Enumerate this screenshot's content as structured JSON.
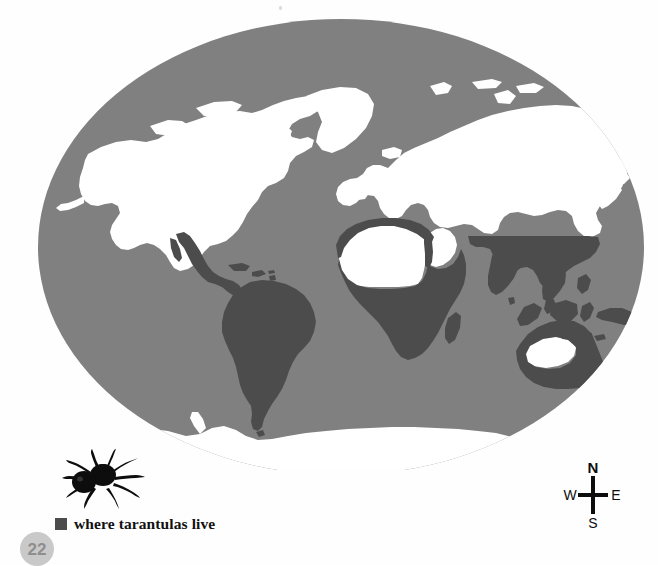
{
  "page": {
    "number": "22",
    "background_color": "#ffffff"
  },
  "map": {
    "title": "where tarantulas live",
    "projection": "elliptical world map",
    "colors": {
      "ocean": "#808080",
      "land_no_habitat": "#ffffff",
      "land_habitat": "#4c4c4c",
      "background": "#ffffff"
    },
    "regions_with_habitat": [
      "Mexico and Central America",
      "Caribbean",
      "South America",
      "Sub-Saharan Africa",
      "North-west Africa (Atlas / coastal Maghreb)",
      "Madagascar",
      "Southern Asia (India and Indochina)",
      "South-east Asia and Indonesia",
      "New Guinea",
      "Australia (coastal)"
    ],
    "regions_without_habitat": [
      "North America",
      "Greenland",
      "Europe",
      "Northern Asia",
      "Sahara interior",
      "Arabian Peninsula",
      "Japan",
      "Central Australia",
      "New Zealand",
      "Antarctica"
    ]
  },
  "legend": {
    "label": "where tarantulas live",
    "swatch_color": "#4c4c4c",
    "illustration": "tarantula-spider"
  },
  "compass": {
    "north": "N",
    "south": "S",
    "east": "E",
    "west": "W"
  }
}
